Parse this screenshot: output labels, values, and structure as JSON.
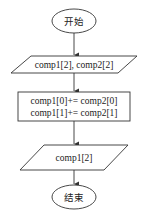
{
  "flowchart": {
    "start": {
      "label": "开始"
    },
    "input": {
      "label": "comp1[2], comp2[2]"
    },
    "process": {
      "lines": [
        "comp1[0]+= comp2[0]",
        "comp1[1]+= comp2[1]"
      ]
    },
    "output": {
      "label": "comp1[2]"
    },
    "end": {
      "label": "结束"
    }
  },
  "colors": {
    "stroke": "#333333",
    "background": "#ffffff",
    "text": "#222222"
  }
}
